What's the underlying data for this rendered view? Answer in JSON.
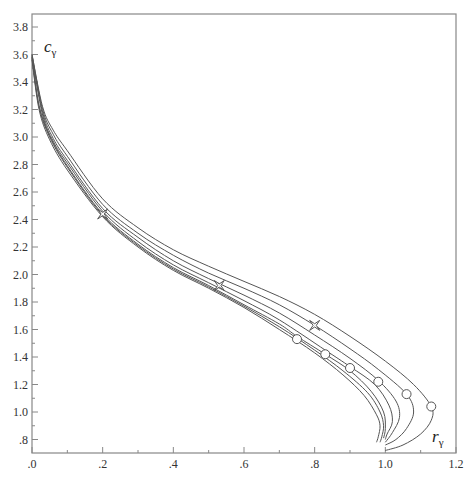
{
  "chart_data": {
    "type": "line",
    "title": "",
    "xlabel": "r",
    "xlabel_sub": "γ",
    "ylabel": "c",
    "ylabel_sub": "γ",
    "xlim": [
      0.0,
      1.2
    ],
    "ylim": [
      0.7,
      3.87
    ],
    "grid": false,
    "legend": null,
    "x_ticks": [
      {
        "value": 0.0,
        "label": ".0"
      },
      {
        "value": 0.2,
        "label": ".2"
      },
      {
        "value": 0.4,
        "label": ".4"
      },
      {
        "value": 0.6,
        "label": ".6"
      },
      {
        "value": 0.8,
        "label": ".8"
      },
      {
        "value": 1.0,
        "label": "1.0"
      },
      {
        "value": 1.2,
        "label": "1.2"
      }
    ],
    "x_minor_ticks": [
      0.1,
      0.3,
      0.5,
      0.7,
      0.9,
      1.1
    ],
    "y_ticks": [
      {
        "value": 0.8,
        "label": ".8"
      },
      {
        "value": 1.0,
        "label": "1.0"
      },
      {
        "value": 1.2,
        "label": "1.2"
      },
      {
        "value": 1.4,
        "label": "1.4"
      },
      {
        "value": 1.6,
        "label": "1.6"
      },
      {
        "value": 1.8,
        "label": "1.8"
      },
      {
        "value": 2.0,
        "label": "2.0"
      },
      {
        "value": 2.2,
        "label": "2.2"
      },
      {
        "value": 2.4,
        "label": "2.4"
      },
      {
        "value": 2.6,
        "label": "2.6"
      },
      {
        "value": 2.8,
        "label": "2.8"
      },
      {
        "value": 3.0,
        "label": "3.0"
      },
      {
        "value": 3.2,
        "label": "3.2"
      },
      {
        "value": 3.4,
        "label": "3.4"
      },
      {
        "value": 3.6,
        "label": "3.6"
      },
      {
        "value": 3.8,
        "label": "3.8"
      }
    ],
    "y_minor_ticks": [
      0.9,
      1.1,
      1.3,
      1.5,
      1.7,
      1.9,
      2.1,
      2.3,
      2.5,
      2.7,
      2.9,
      3.1,
      3.3,
      3.5,
      3.7
    ],
    "series": [
      {
        "name": "curve-1",
        "points": [
          [
            0.0,
            3.56
          ],
          [
            0.02,
            3.2
          ],
          [
            0.05,
            2.98
          ],
          [
            0.1,
            2.76
          ],
          [
            0.2,
            2.42
          ],
          [
            0.3,
            2.2
          ],
          [
            0.4,
            2.03
          ],
          [
            0.5,
            1.9
          ],
          [
            0.6,
            1.76
          ],
          [
            0.7,
            1.6
          ],
          [
            0.8,
            1.43
          ],
          [
            0.88,
            1.27
          ],
          [
            0.94,
            1.12
          ],
          [
            0.975,
            0.98
          ],
          [
            0.985,
            0.9
          ],
          [
            0.98,
            0.82
          ],
          [
            0.975,
            0.78
          ]
        ]
      },
      {
        "name": "curve-2",
        "points": [
          [
            0.0,
            3.57
          ],
          [
            0.02,
            3.22
          ],
          [
            0.05,
            3.0
          ],
          [
            0.1,
            2.78
          ],
          [
            0.2,
            2.43
          ],
          [
            0.3,
            2.21
          ],
          [
            0.4,
            2.04
          ],
          [
            0.5,
            1.91
          ],
          [
            0.6,
            1.77
          ],
          [
            0.7,
            1.62
          ],
          [
            0.8,
            1.45
          ],
          [
            0.88,
            1.3
          ],
          [
            0.95,
            1.14
          ],
          [
            0.985,
            1.0
          ],
          [
            0.995,
            0.9
          ],
          [
            0.99,
            0.82
          ],
          [
            0.985,
            0.78
          ]
        ]
      },
      {
        "name": "curve-3",
        "points": [
          [
            0.0,
            3.58
          ],
          [
            0.02,
            3.23
          ],
          [
            0.05,
            3.01
          ],
          [
            0.1,
            2.79
          ],
          [
            0.2,
            2.44
          ],
          [
            0.3,
            2.22
          ],
          [
            0.4,
            2.05
          ],
          [
            0.5,
            1.92
          ],
          [
            0.6,
            1.78
          ],
          [
            0.7,
            1.64
          ],
          [
            0.75,
            1.55
          ],
          [
            0.83,
            1.42
          ],
          [
            0.9,
            1.3
          ],
          [
            0.96,
            1.15
          ],
          [
            0.995,
            1.0
          ],
          [
            1.0,
            0.88
          ],
          [
            0.995,
            0.81
          ]
        ]
      },
      {
        "name": "curve-4",
        "points": [
          [
            0.0,
            3.58
          ],
          [
            0.03,
            3.16
          ],
          [
            0.06,
            2.97
          ],
          [
            0.1,
            2.81
          ],
          [
            0.2,
            2.46
          ],
          [
            0.3,
            2.24
          ],
          [
            0.4,
            2.07
          ],
          [
            0.5,
            1.94
          ],
          [
            0.6,
            1.81
          ],
          [
            0.7,
            1.67
          ],
          [
            0.83,
            1.45
          ],
          [
            0.9,
            1.33
          ],
          [
            0.97,
            1.2
          ],
          [
            1.01,
            1.05
          ],
          [
            1.02,
            0.93
          ],
          [
            1.005,
            0.84
          ],
          [
            1.0,
            0.8
          ]
        ]
      },
      {
        "name": "curve-5",
        "points": [
          [
            0.0,
            3.59
          ],
          [
            0.03,
            3.18
          ],
          [
            0.06,
            2.99
          ],
          [
            0.1,
            2.83
          ],
          [
            0.2,
            2.48
          ],
          [
            0.3,
            2.27
          ],
          [
            0.4,
            2.1
          ],
          [
            0.5,
            1.97
          ],
          [
            0.6,
            1.85
          ],
          [
            0.7,
            1.72
          ],
          [
            0.8,
            1.56
          ],
          [
            0.9,
            1.39
          ],
          [
            0.98,
            1.23
          ],
          [
            1.03,
            1.08
          ],
          [
            1.04,
            0.96
          ],
          [
            1.02,
            0.85
          ],
          [
            1.0,
            0.78
          ]
        ]
      },
      {
        "name": "curve-6",
        "points": [
          [
            0.0,
            3.6
          ],
          [
            0.03,
            3.2
          ],
          [
            0.06,
            3.02
          ],
          [
            0.1,
            2.86
          ],
          [
            0.2,
            2.51
          ],
          [
            0.3,
            2.3
          ],
          [
            0.4,
            2.14
          ],
          [
            0.5,
            2.01
          ],
          [
            0.6,
            1.9
          ],
          [
            0.7,
            1.78
          ],
          [
            0.8,
            1.63
          ],
          [
            0.9,
            1.46
          ],
          [
            0.98,
            1.31
          ],
          [
            1.06,
            1.13
          ],
          [
            1.08,
            1.0
          ],
          [
            1.06,
            0.88
          ],
          [
            1.03,
            0.8
          ],
          [
            1.0,
            0.76
          ]
        ]
      },
      {
        "name": "curve-7",
        "points": [
          [
            0.0,
            3.6
          ],
          [
            0.03,
            3.22
          ],
          [
            0.06,
            3.05
          ],
          [
            0.1,
            2.9
          ],
          [
            0.2,
            2.55
          ],
          [
            0.3,
            2.34
          ],
          [
            0.4,
            2.18
          ],
          [
            0.5,
            2.06
          ],
          [
            0.6,
            1.95
          ],
          [
            0.7,
            1.84
          ],
          [
            0.8,
            1.71
          ],
          [
            0.9,
            1.55
          ],
          [
            1.0,
            1.37
          ],
          [
            1.08,
            1.2
          ],
          [
            1.13,
            1.04
          ],
          [
            1.13,
            0.94
          ],
          [
            1.1,
            0.84
          ],
          [
            1.05,
            0.76
          ],
          [
            1.0,
            0.72
          ]
        ]
      }
    ],
    "circle_markers": [
      [
        0.75,
        1.53
      ],
      [
        0.83,
        1.42
      ],
      [
        0.9,
        1.32
      ],
      [
        0.98,
        1.22
      ],
      [
        1.06,
        1.13
      ],
      [
        1.13,
        1.04
      ]
    ],
    "star_markers": [
      [
        0.2,
        2.44
      ],
      [
        0.53,
        1.92
      ],
      [
        0.8,
        1.63
      ]
    ],
    "colors": {
      "line": "#555555",
      "axis": "#888888",
      "text": "#333333"
    }
  }
}
